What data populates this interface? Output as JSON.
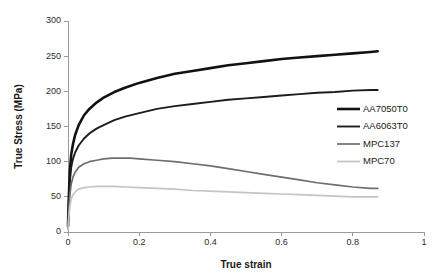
{
  "chart_data": {
    "type": "line",
    "title": "",
    "xlabel": "True strain",
    "ylabel": "True Stress (MPa)",
    "xlim": [
      0,
      1
    ],
    "ylim": [
      0,
      300
    ],
    "xticks": [
      "0",
      "0.2",
      "0.4",
      "0.6",
      "0.8",
      "1"
    ],
    "xtick_values": [
      0,
      0.2,
      0.4,
      0.6,
      0.8,
      1
    ],
    "yticks": [
      "0",
      "50",
      "100",
      "150",
      "200",
      "250",
      "300"
    ],
    "ytick_values": [
      0,
      50,
      100,
      150,
      200,
      250,
      300
    ],
    "grid": false,
    "legend_position": "upper-right-inside",
    "series": [
      {
        "name": "AA7050T0",
        "color": "#121212",
        "width": 2.6,
        "x": [
          0,
          0.002,
          0.005,
          0.009,
          0.014,
          0.02,
          0.03,
          0.045,
          0.06,
          0.08,
          0.1,
          0.13,
          0.16,
          0.2,
          0.25,
          0.3,
          0.35,
          0.4,
          0.45,
          0.5,
          0.55,
          0.6,
          0.65,
          0.7,
          0.75,
          0.8,
          0.85,
          0.87
        ],
        "y": [
          8,
          45,
          85,
          110,
          125,
          138,
          152,
          166,
          175,
          184,
          191,
          199,
          205,
          212,
          219,
          225,
          229,
          233,
          237,
          240,
          243,
          246,
          248,
          250,
          252,
          254,
          256,
          257
        ]
      },
      {
        "name": "AA6063T0",
        "color": "#1c1c1c",
        "width": 1.9,
        "x": [
          0,
          0.002,
          0.005,
          0.009,
          0.014,
          0.02,
          0.03,
          0.045,
          0.06,
          0.08,
          0.1,
          0.13,
          0.16,
          0.2,
          0.25,
          0.3,
          0.35,
          0.4,
          0.45,
          0.5,
          0.55,
          0.6,
          0.65,
          0.7,
          0.75,
          0.8,
          0.85,
          0.87
        ],
        "y": [
          6,
          38,
          70,
          92,
          104,
          113,
          123,
          133,
          140,
          147,
          152,
          159,
          164,
          169,
          175,
          179,
          182,
          185,
          188,
          190,
          192,
          194,
          196,
          198,
          199,
          201,
          202,
          202
        ]
      },
      {
        "name": "MPC137",
        "color": "#6e6e6e",
        "width": 1.7,
        "x": [
          0,
          0.002,
          0.005,
          0.009,
          0.014,
          0.02,
          0.03,
          0.045,
          0.06,
          0.08,
          0.1,
          0.125,
          0.15,
          0.175,
          0.2,
          0.25,
          0.3,
          0.35,
          0.4,
          0.45,
          0.5,
          0.55,
          0.6,
          0.65,
          0.7,
          0.75,
          0.8,
          0.85,
          0.87
        ],
        "y": [
          4,
          28,
          52,
          68,
          78,
          85,
          92,
          97,
          100,
          102,
          104,
          105,
          105,
          105,
          104,
          102,
          100,
          97,
          94,
          90,
          86,
          82,
          78,
          74,
          70,
          67,
          64,
          62,
          62
        ]
      },
      {
        "name": "MPC70",
        "color": "#c4c4c4",
        "width": 1.7,
        "x": [
          0,
          0.002,
          0.005,
          0.009,
          0.014,
          0.02,
          0.03,
          0.045,
          0.06,
          0.08,
          0.1,
          0.13,
          0.16,
          0.2,
          0.25,
          0.3,
          0.35,
          0.4,
          0.45,
          0.5,
          0.55,
          0.6,
          0.65,
          0.7,
          0.75,
          0.8,
          0.85,
          0.87
        ],
        "y": [
          3,
          20,
          36,
          47,
          53,
          57,
          61,
          63,
          64,
          65,
          65,
          65,
          64,
          63,
          62,
          61,
          59,
          58,
          57,
          56,
          55,
          54,
          53,
          52,
          51,
          50,
          50,
          50
        ]
      }
    ]
  }
}
